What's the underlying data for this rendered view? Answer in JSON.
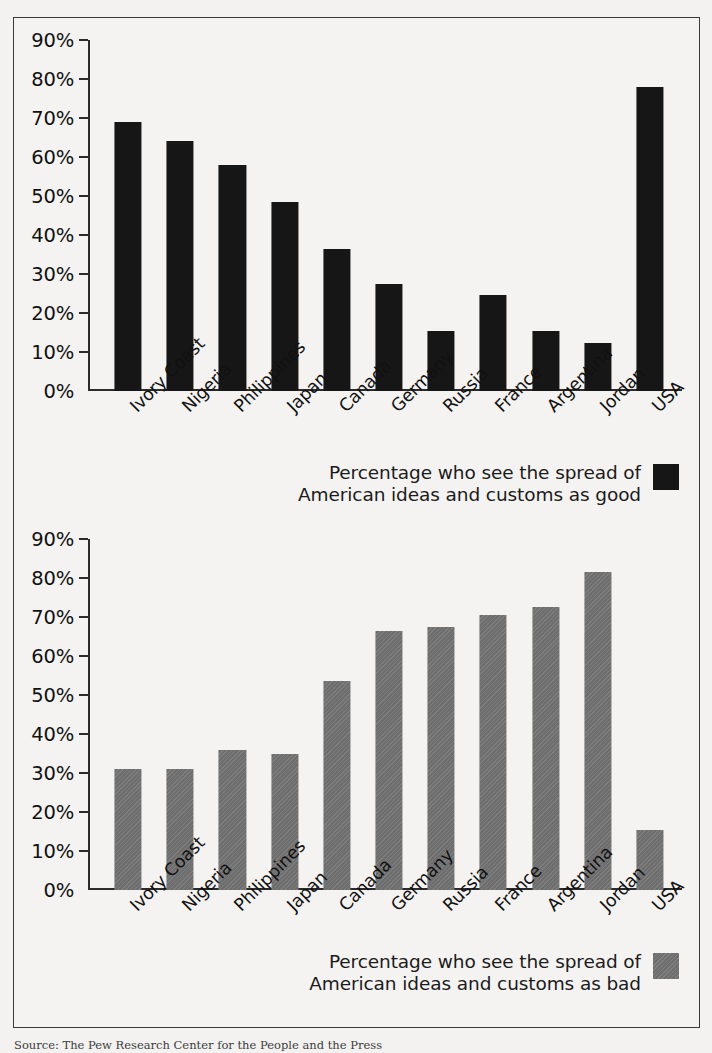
{
  "figure": {
    "source_note": "Source: The Pew Research Center for the People and the Press"
  },
  "charts": [
    {
      "id": "good",
      "legend_label": "Percentage who see the spread of\nAmerican ideas and customs as good",
      "swatch_color": "#161616",
      "swatch_name": "legend-swatch-good"
    },
    {
      "id": "bad",
      "legend_label": "Percentage who see the spread of\nAmerican ideas and customs as bad",
      "swatch_color": "#6e6e6e",
      "swatch_name": "legend-swatch-bad"
    }
  ],
  "chart_data": [
    {
      "type": "bar",
      "title": "",
      "xlabel": "",
      "ylabel": "",
      "ylim": [
        0,
        90
      ],
      "yticks": [
        0,
        10,
        20,
        30,
        40,
        50,
        60,
        70,
        80,
        90
      ],
      "ytick_labels": [
        "0%",
        "10%",
        "20%",
        "30%",
        "40%",
        "50%",
        "60%",
        "70%",
        "80%",
        "90%"
      ],
      "grid": false,
      "legend_position": "bottom-right",
      "series_name": "Percentage who see the spread of American ideas and customs as good",
      "color": "#161616",
      "categories": [
        "Ivory Coast",
        "Nigeria",
        "Philippines",
        "Japan",
        "Canada",
        "Germany",
        "Russia",
        "France",
        "Argentina",
        "Jordan",
        "USA"
      ],
      "values": [
        69,
        64,
        58,
        48.5,
        36.5,
        27.5,
        15.5,
        24.5,
        15.3,
        12.3,
        78
      ]
    },
    {
      "type": "bar",
      "title": "",
      "xlabel": "",
      "ylabel": "",
      "ylim": [
        0,
        90
      ],
      "yticks": [
        0,
        10,
        20,
        30,
        40,
        50,
        60,
        70,
        80,
        90
      ],
      "ytick_labels": [
        "0%",
        "10%",
        "20%",
        "30%",
        "40%",
        "50%",
        "60%",
        "70%",
        "80%",
        "90%"
      ],
      "grid": false,
      "legend_position": "bottom-right",
      "series_name": "Percentage who see the spread of American ideas and customs as bad",
      "color": "#6e6e6e",
      "categories": [
        "Ivory Coast",
        "Nigeria",
        "Philippines",
        "Japan",
        "Canada",
        "Germany",
        "Russia",
        "France",
        "Argentina",
        "Jordan",
        "USA"
      ],
      "values": [
        31,
        31,
        36,
        35,
        53.5,
        66.5,
        67.5,
        70.5,
        72.5,
        81.5,
        15.5
      ]
    }
  ]
}
